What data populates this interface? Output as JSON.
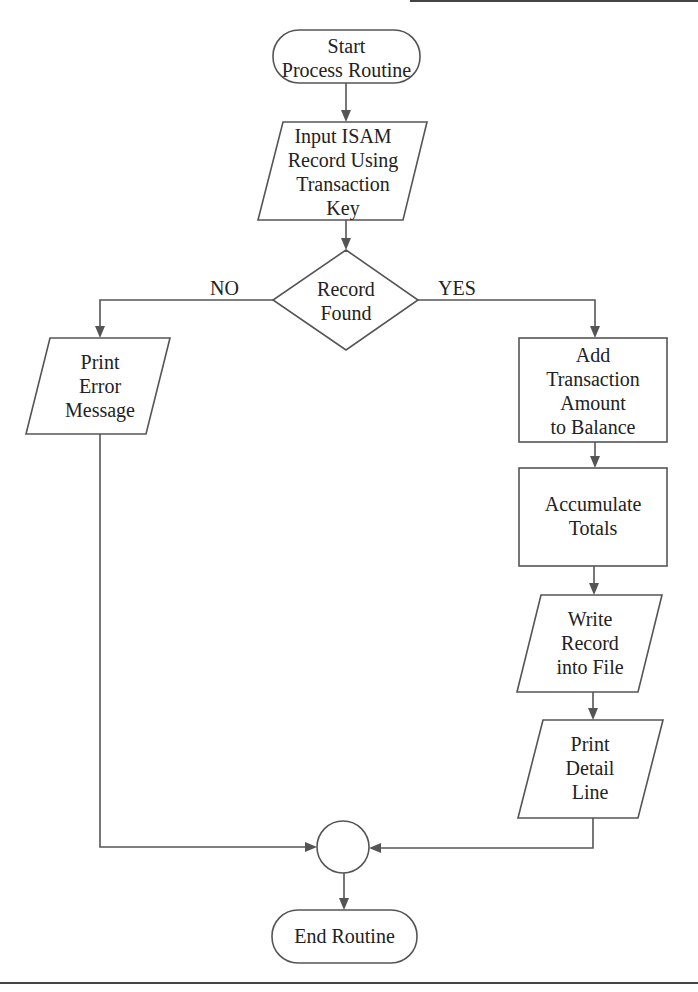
{
  "diagram": {
    "type": "flowchart",
    "colors": {
      "stroke": "#555555",
      "text": "#222222",
      "background": "#ffffff"
    },
    "nodes": {
      "start": {
        "shape": "terminal",
        "lines": [
          "Start",
          "Process Routine"
        ]
      },
      "input_record": {
        "shape": "parallelogram",
        "lines": [
          "Input ISAM",
          "Record Using",
          "Transaction",
          "Key"
        ]
      },
      "decision": {
        "shape": "diamond",
        "lines": [
          "Record",
          "Found"
        ]
      },
      "print_error": {
        "shape": "parallelogram",
        "lines": [
          "Print",
          "Error",
          "Message"
        ]
      },
      "add_transaction": {
        "shape": "process",
        "lines": [
          "Add",
          "Transaction",
          "Amount",
          "to Balance"
        ]
      },
      "accumulate": {
        "shape": "process",
        "lines": [
          "Accumulate",
          "Totals"
        ]
      },
      "write_record": {
        "shape": "parallelogram",
        "lines": [
          "Write",
          "Record",
          "into File"
        ]
      },
      "print_detail": {
        "shape": "parallelogram",
        "lines": [
          "Print",
          "Detail",
          "Line"
        ]
      },
      "connector": {
        "shape": "circle",
        "lines": []
      },
      "end": {
        "shape": "terminal",
        "lines": [
          "End Routine"
        ]
      }
    },
    "branch_labels": {
      "no": "NO",
      "yes": "YES"
    },
    "edges": [
      {
        "from": "start",
        "to": "input_record"
      },
      {
        "from": "input_record",
        "to": "decision"
      },
      {
        "from": "decision",
        "to": "print_error",
        "label": "NO"
      },
      {
        "from": "decision",
        "to": "add_transaction",
        "label": "YES"
      },
      {
        "from": "add_transaction",
        "to": "accumulate"
      },
      {
        "from": "accumulate",
        "to": "write_record"
      },
      {
        "from": "write_record",
        "to": "print_detail"
      },
      {
        "from": "print_error",
        "to": "connector"
      },
      {
        "from": "print_detail",
        "to": "connector"
      },
      {
        "from": "connector",
        "to": "end"
      }
    ]
  }
}
